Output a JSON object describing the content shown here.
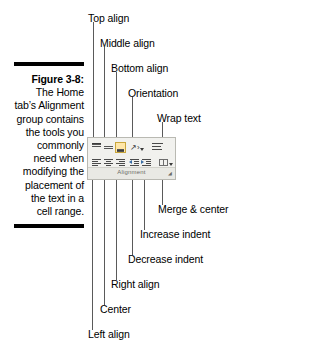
{
  "figure": {
    "label": "Figure 3-8:",
    "body": "The Home tab’s Alignment group contains the tools you commonly need when modifying the placement of the text in a cell range."
  },
  "callouts": [
    {
      "id": "top-align",
      "label": "Top align"
    },
    {
      "id": "middle-align",
      "label": "Middle align"
    },
    {
      "id": "bottom-align",
      "label": "Bottom align"
    },
    {
      "id": "orientation",
      "label": "Orientation"
    },
    {
      "id": "wrap-text",
      "label": "Wrap text"
    },
    {
      "id": "merge-center",
      "label": "Merge & center"
    },
    {
      "id": "increase-indent",
      "label": "Increase indent"
    },
    {
      "id": "decrease-indent",
      "label": "Decrease indent"
    },
    {
      "id": "right-align",
      "label": "Right align"
    },
    {
      "id": "center",
      "label": "Center"
    },
    {
      "id": "left-align",
      "label": "Left align"
    }
  ],
  "ribbon": {
    "group_title": "Alignment",
    "dialog_launcher_glyph": "◢",
    "top_row": [
      {
        "id": "top-align",
        "icon": "align-top-icon",
        "selected": false
      },
      {
        "id": "middle-align",
        "icon": "align-middle-icon",
        "selected": false
      },
      {
        "id": "bottom-align",
        "icon": "align-bottom-icon",
        "selected": true
      },
      {
        "id": "orientation",
        "icon": "orientation-icon",
        "selected": false
      },
      {
        "id": "wrap-text",
        "icon": "wrap-text-icon",
        "selected": false
      }
    ],
    "bottom_row": [
      {
        "id": "left-align",
        "icon": "align-left-icon",
        "selected": false
      },
      {
        "id": "center",
        "icon": "align-center-icon",
        "selected": false
      },
      {
        "id": "right-align",
        "icon": "align-right-icon",
        "selected": false
      },
      {
        "id": "decrease-indent",
        "icon": "decrease-indent-icon",
        "selected": false
      },
      {
        "id": "increase-indent",
        "icon": "increase-indent-icon",
        "selected": false
      },
      {
        "id": "merge-center",
        "icon": "merge-center-icon",
        "selected": false
      }
    ]
  },
  "colors": {
    "page_background": "#ffffff",
    "text": "#000000",
    "rule": "#000000",
    "ribbon_background": "#f1f1ee",
    "ribbon_border": "#b9b9b2",
    "ribbon_footer": "#e9e9e4",
    "selected_button": "#ffe6a8",
    "leader_line": "#5a5a5a"
  }
}
